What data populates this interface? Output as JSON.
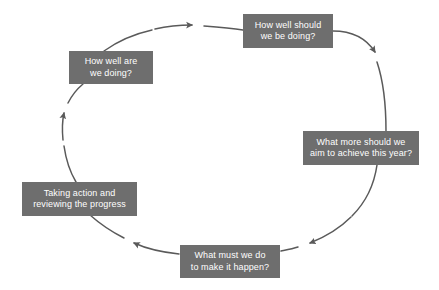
{
  "diagram": {
    "type": "cycle",
    "direction": "clockwise",
    "background_color": "#ffffff",
    "box_fill_color": "#6e6e6e",
    "box_text_color": "#ffffff",
    "arrow_color": "#5a5a5a",
    "nodes": [
      {
        "id": "how-well-should-we-be-doing",
        "order": 1,
        "line1": "How well should",
        "line2": "we be doing?",
        "position": "top"
      },
      {
        "id": "what-more-should-we-aim-to-achieve",
        "order": 2,
        "line1": "What more should we",
        "line2": "aim to achieve this year?",
        "position": "right"
      },
      {
        "id": "what-must-we-do-to-make-it-happen",
        "order": 3,
        "line1": "What must we do",
        "line2": "to make it happen?",
        "position": "bottom"
      },
      {
        "id": "taking-action-and-reviewing-the-progress",
        "order": 4,
        "line1": "Taking action and",
        "line2": "reviewing the progress",
        "position": "left"
      },
      {
        "id": "how-well-are-we-doing",
        "order": 5,
        "line1": "How well are",
        "line2": "we doing?",
        "position": "top-left"
      }
    ],
    "connectors": [
      {
        "id": "arrow-top-to-right",
        "from": "how-well-should-we-be-doing",
        "to": "what-more-should-we-aim-to-achieve"
      },
      {
        "id": "arrow-right-to-bottom",
        "from": "what-more-should-we-aim-to-achieve",
        "to": "what-must-we-do-to-make-it-happen"
      },
      {
        "id": "arrow-bottom-to-left",
        "from": "what-must-we-do-to-make-it-happen",
        "to": "taking-action-and-reviewing-the-progress"
      },
      {
        "id": "arrow-left-to-topleft",
        "from": "taking-action-and-reviewing-the-progress",
        "to": "how-well-are-we-doing"
      },
      {
        "id": "arrow-topleft-to-top",
        "from": "how-well-are-we-doing",
        "to": "how-well-should-we-be-doing"
      }
    ]
  }
}
